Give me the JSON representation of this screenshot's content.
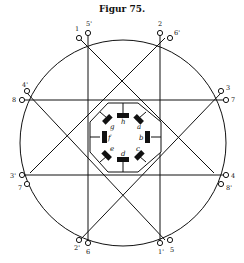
{
  "figure": {
    "title": "Figur 75."
  },
  "diagram": {
    "terminal_labels": {
      "top_left_outer": "1",
      "top_left_inner": "5'",
      "top_right_outer": "2",
      "top_right_inner": "6'",
      "right_upper_outer": "3",
      "right_upper_inner": "7",
      "right_lower_outer": "4",
      "right_lower_inner": "8'",
      "bottom_right_outer": "5",
      "bottom_right_inner": "1'",
      "bottom_left_outer": "6",
      "bottom_left_inner": "2'",
      "left_lower_outer": "7",
      "left_lower_inner": "3'",
      "left_upper_outer": "8",
      "left_upper_inner": "4'"
    },
    "hub_labels": [
      "a",
      "b",
      "c",
      "d",
      "e",
      "f",
      "g",
      "h"
    ]
  }
}
